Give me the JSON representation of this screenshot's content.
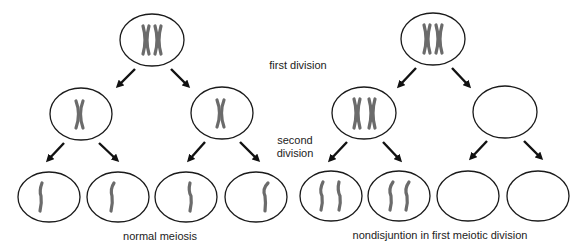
{
  "labels": {
    "first_division": "first division",
    "second_division_line1": "second",
    "second_division_line2": "division",
    "normal_caption": "normal meiosis",
    "nondisjunction_caption": "nondisjuntion in first meiotic division"
  },
  "colors": {
    "cell_outline": "#1a1a1a",
    "chromosome": "#6b6b6b",
    "arrow": "#111111",
    "text": "#222222"
  },
  "panels": [
    {
      "name": "normal-meiosis",
      "parent_cell": {
        "chromosomes": 2,
        "type": "paired-X"
      },
      "first_division_cells": [
        {
          "chromosomes": 1,
          "type": "X"
        },
        {
          "chromosomes": 1,
          "type": "X"
        }
      ],
      "gametes": [
        {
          "chromatids": 1
        },
        {
          "chromatids": 1
        },
        {
          "chromatids": 1
        },
        {
          "chromatids": 1
        }
      ]
    },
    {
      "name": "nondisjunction",
      "parent_cell": {
        "chromosomes": 2,
        "type": "paired-X"
      },
      "first_division_cells": [
        {
          "chromosomes": 2,
          "type": "X"
        },
        {
          "chromosomes": 0,
          "type": "empty"
        }
      ],
      "gametes": [
        {
          "chromatids": 2
        },
        {
          "chromatids": 2
        },
        {
          "chromatids": 0
        },
        {
          "chromatids": 0
        }
      ]
    }
  ]
}
